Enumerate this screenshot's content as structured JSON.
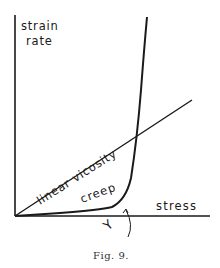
{
  "figure": {
    "caption": "Fig. 9.",
    "y_axis_label_line1": "strain",
    "y_axis_label_line2": "rate",
    "x_axis_label": "stress",
    "curve_linear_label": "linear vicosity",
    "curve_creep_label": "creep",
    "yield_marker_label": "Y",
    "colors": {
      "ink": "#1a1a1a",
      "background": "#ffffff"
    }
  }
}
